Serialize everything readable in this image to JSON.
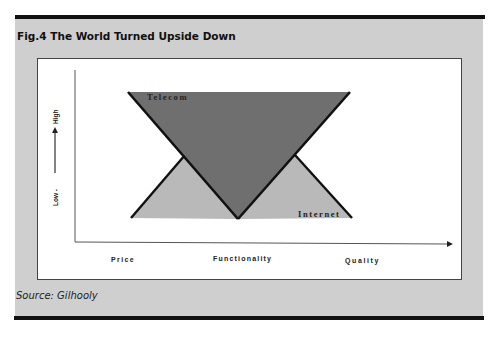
{
  "figure": {
    "title": "Fig.4 The World Turned Upside Down",
    "source": "Source: Gilhooly"
  },
  "diagram": {
    "y_axis": {
      "low_label": "Low -",
      "high_label": "High",
      "arrow": "up-arrow"
    },
    "x_axis": {
      "labels": [
        "Price",
        "Functionality",
        "Quality"
      ]
    },
    "shapes": {
      "telecom": {
        "label": "Telecom",
        "type": "inverted-triangle",
        "fill": "#6f6f6f"
      },
      "internet": {
        "label": "Internet",
        "type": "upright-triangles",
        "fill": "#b9b9b9"
      }
    },
    "colors": {
      "panel_background": "#cfcfcf",
      "figure_background": "#ffffff",
      "outline": "#111111"
    }
  }
}
